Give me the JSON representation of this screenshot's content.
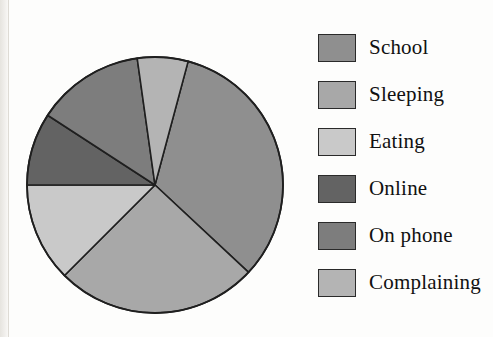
{
  "chart_data": {
    "type": "pie",
    "title": "",
    "categories": [
      "School",
      "Sleeping",
      "Eating",
      "Online",
      "On phone",
      "Complaining"
    ],
    "values": [
      32.8,
      25.6,
      12.5,
      9.2,
      13.6,
      6.3
    ],
    "units": "percent",
    "start_angle_deg": 15,
    "direction": "clockwise",
    "legend_position": "right",
    "grid": false,
    "slices": [
      {
        "label": "School",
        "value": 32.8,
        "color": "#8f8f8f",
        "start_deg": 15,
        "end_deg": 133
      },
      {
        "label": "Sleeping",
        "value": 25.6,
        "color": "#a8a8a8",
        "start_deg": 133,
        "end_deg": 225
      },
      {
        "label": "Eating",
        "value": 12.5,
        "color": "#c9c9c9",
        "start_deg": 225,
        "end_deg": 270
      },
      {
        "label": "Online",
        "value": 9.2,
        "color": "#636363",
        "start_deg": 270,
        "end_deg": 303
      },
      {
        "label": "On phone",
        "value": 13.6,
        "color": "#7d7d7d",
        "start_deg": 303,
        "end_deg": 352
      },
      {
        "label": "Complaining",
        "value": 6.3,
        "color": "#b4b4b4",
        "start_deg": 352,
        "end_deg": 375
      }
    ],
    "geometry": {
      "cx": 155,
      "cy": 185,
      "r": 128
    },
    "stroke_color": "#1f1f1f"
  },
  "legend": {
    "items": [
      {
        "label": "School",
        "color": "#8f8f8f"
      },
      {
        "label": "Sleeping",
        "color": "#a8a8a8"
      },
      {
        "label": "Eating",
        "color": "#c9c9c9"
      },
      {
        "label": "Online",
        "color": "#636363"
      },
      {
        "label": "On phone",
        "color": "#7d7d7d"
      },
      {
        "label": "Complaining",
        "color": "#b4b4b4"
      }
    ]
  }
}
